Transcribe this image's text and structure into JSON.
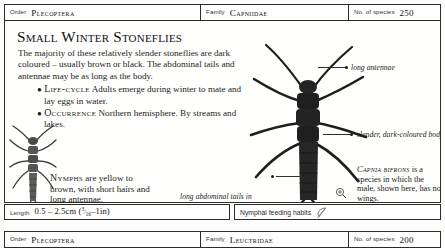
{
  "header": {
    "order_label": "Order",
    "order_value": "Plecoptera",
    "family_label": "Family",
    "family_value": "Capniidae",
    "species_label": "No. of species",
    "species_value": "250"
  },
  "footer": {
    "order_label": "Order",
    "order_value": "Plecoptera",
    "family_label": "Family",
    "family_value": "Leuctridae",
    "species_label": "No. of species",
    "species_value": "200"
  },
  "article": {
    "headline": "Small Winter Stoneflies",
    "intro": "The majority of these relatively slender stoneflies are dark coloured – usually brown or black. The abdominal tails and antennae may be as long as the body.",
    "bullets": [
      {
        "term": "Life-cycle",
        "text": "Adults emerge during winter to mate and lay eggs in water."
      },
      {
        "term": "Occurrence",
        "text": "Northern hemisphere. By streams and lakes."
      }
    ],
    "nymph_note_term": "Nymphs",
    "nymph_note": " are yellow to brown, with short hairs and long antennae."
  },
  "callouts": {
    "antennae": "long antennae",
    "body": "slender, dark-coloured body",
    "tails": "long abdominal tails in adults and nymphs"
  },
  "species_block": {
    "name": "Capnia bifrons",
    "text": " is a species in which the male, shown here, has no wings."
  },
  "infobar": {
    "length_label": "Length",
    "length_value_metric": "0.5 – 2.5cm (",
    "length_fraction_num": "3",
    "length_fraction_den": "16",
    "length_value_imperial": "–1in)",
    "feeding_label": "Nymphal feeding habits",
    "feeding_icon": "feather-icon"
  },
  "colors": {
    "border": "#2b2b2b",
    "ink": "#1a1a1a",
    "paper": "#fdfdfb"
  }
}
